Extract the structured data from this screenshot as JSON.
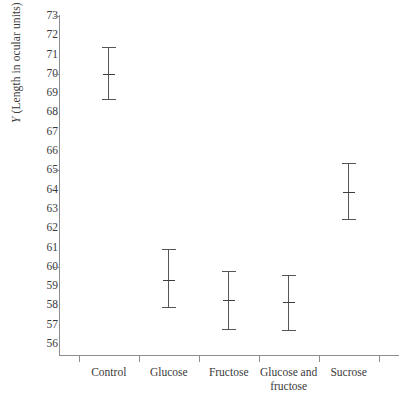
{
  "chart_data": {
    "type": "scatter",
    "title": "",
    "xlabel": "",
    "ylabel": "Y (Length in ocular units)",
    "ylabel_italic_prefix": "Y",
    "ylabel_rest": " (Length in ocular units)",
    "ylim": [
      56,
      73
    ],
    "grid": false,
    "legend": "none",
    "error_bar_meaning": "mean with error bar (mean ± spread)",
    "yticks": [
      73,
      72,
      71,
      70,
      69,
      68,
      67,
      66,
      65,
      64,
      63,
      62,
      61,
      60,
      59,
      58,
      57,
      56
    ],
    "major_yticks": [
      73,
      70,
      65,
      60
    ],
    "categories": [
      "Control",
      "Glucose",
      "Fructose",
      "Glucose and fructose",
      "Sucrose"
    ],
    "category_labels": [
      {
        "line1": "Control",
        "line2": ""
      },
      {
        "line1": "Glucose",
        "line2": ""
      },
      {
        "line1": "Fructose",
        "line2": ""
      },
      {
        "line1": "Glucose and",
        "line2": "fructose"
      },
      {
        "line1": "Sucrose",
        "line2": ""
      }
    ],
    "series": [
      {
        "name": "Mean length",
        "values": [
          70.0,
          59.3,
          58.3,
          58.2,
          63.9
        ],
        "lower": [
          68.7,
          57.9,
          56.8,
          56.7,
          62.5
        ],
        "upper": [
          71.4,
          60.9,
          59.8,
          59.6,
          65.4
        ]
      }
    ],
    "points": [
      {
        "category": "Control",
        "mean": 70.0,
        "lower": 68.7,
        "upper": 71.4
      },
      {
        "category": "Glucose",
        "mean": 59.3,
        "lower": 57.9,
        "upper": 60.9
      },
      {
        "category": "Fructose",
        "mean": 58.3,
        "lower": 56.8,
        "upper": 59.8
      },
      {
        "category": "Glucose and fructose",
        "mean": 58.2,
        "lower": 56.7,
        "upper": 59.6
      },
      {
        "category": "Sucrose",
        "mean": 63.9,
        "lower": 62.5,
        "upper": 65.4
      }
    ]
  },
  "colors": {
    "axis": "#8d8d8d",
    "text": "#3a3a3a",
    "errorbar": "#555555",
    "background": "#ffffff"
  }
}
